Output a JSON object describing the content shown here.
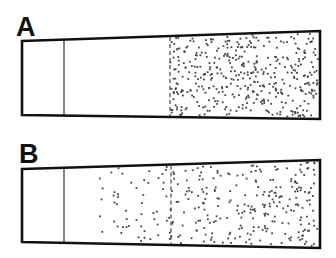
{
  "colors": {
    "outline": "#111111",
    "divider": "#333333",
    "dot": "#444444",
    "background": "#ffffff"
  },
  "panels": [
    {
      "id": "A",
      "label": "A",
      "label_pos": [
        16,
        14
      ],
      "outline": {
        "left_x": 22,
        "right_x": 320,
        "left_top": 41,
        "left_bottom": 115,
        "right_top": 31,
        "right_bottom": 119
      },
      "solid_divider_x": 64,
      "dashed_divider_x": 170,
      "particles": {
        "region_start_x": 170,
        "region_end_x": 318,
        "count": 420,
        "distribution": "uniform",
        "seed": 7
      }
    },
    {
      "id": "B",
      "label": "B",
      "label_pos": [
        19,
        141
      ],
      "outline": {
        "left_x": 22,
        "right_x": 320,
        "left_top": 169,
        "left_bottom": 242,
        "right_top": 160,
        "right_bottom": 248
      },
      "solid_divider_x": 64,
      "dashed_divider_x": 171,
      "particles": {
        "region_start_x": 88,
        "region_end_x": 318,
        "count": 300,
        "distribution": "ramp",
        "seed": 13
      }
    }
  ]
}
